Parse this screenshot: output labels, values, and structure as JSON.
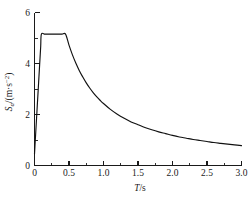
{
  "chart_data": {
    "type": "line",
    "title": "",
    "xlabel": "T/s",
    "xlabel_symbol": "T",
    "xlabel_unit": "s",
    "ylabel": "Sa/(m·s-2)",
    "ylabel_symbol": "S",
    "ylabel_subscript": "a",
    "ylabel_unit_open": "/(m·s",
    "ylabel_unit_exp": "−2",
    "ylabel_unit_close": ")",
    "xlim": [
      0,
      3.0
    ],
    "ylim": [
      0,
      6
    ],
    "grid": false,
    "legend": null,
    "x_ticks_major": [
      "0",
      "0.5",
      "1.0",
      "1.5",
      "2.0",
      "2.5",
      "3.0"
    ],
    "x_ticks_major_values": [
      0,
      0.5,
      1.0,
      1.5,
      2.0,
      2.5,
      3.0
    ],
    "x_ticks_minor_values": [
      0.25,
      0.75,
      1.25,
      1.75,
      2.25,
      2.75
    ],
    "y_ticks_major": [
      "0",
      "2",
      "4",
      "6"
    ],
    "y_ticks_major_values": [
      0,
      2,
      4,
      6
    ],
    "y_ticks_minor_values": [
      1,
      3,
      5
    ],
    "series": [
      {
        "name": "design response spectrum",
        "color": "#111111",
        "x": [
          0.0,
          0.01,
          0.02,
          0.03,
          0.04,
          0.05,
          0.06,
          0.07,
          0.08,
          0.09,
          0.1,
          0.15,
          0.2,
          0.25,
          0.3,
          0.35,
          0.4,
          0.45,
          0.5,
          0.55,
          0.6,
          0.65,
          0.7,
          0.75,
          0.8,
          0.85,
          0.9,
          0.95,
          1.0,
          1.1,
          1.2,
          1.3,
          1.4,
          1.5,
          1.6,
          1.7,
          1.8,
          1.9,
          2.0,
          2.1,
          2.2,
          2.3,
          2.4,
          2.5,
          2.6,
          2.7,
          2.8,
          2.9,
          3.0
        ],
        "y": [
          0.45,
          0.92,
          1.39,
          1.86,
          2.33,
          2.8,
          3.27,
          3.74,
          4.21,
          4.68,
          5.15,
          5.15,
          5.15,
          5.15,
          5.15,
          5.15,
          5.15,
          5.15,
          4.72,
          4.34,
          4.01,
          3.72,
          3.47,
          3.24,
          3.04,
          2.86,
          2.7,
          2.56,
          2.43,
          2.2,
          2.01,
          1.85,
          1.71,
          1.6,
          1.49,
          1.4,
          1.32,
          1.25,
          1.18,
          1.12,
          1.07,
          1.02,
          0.98,
          0.94,
          0.9,
          0.87,
          0.84,
          0.81,
          0.78
        ],
        "plateau_value": 5.15,
        "plateau_start_t": 0.1,
        "plateau_end_t": 0.45,
        "value_at_t3": 0.78
      }
    ]
  },
  "figure": {
    "axis_color": "#1a1a1a",
    "curve_color": "#111111",
    "background": "#ffffff"
  }
}
